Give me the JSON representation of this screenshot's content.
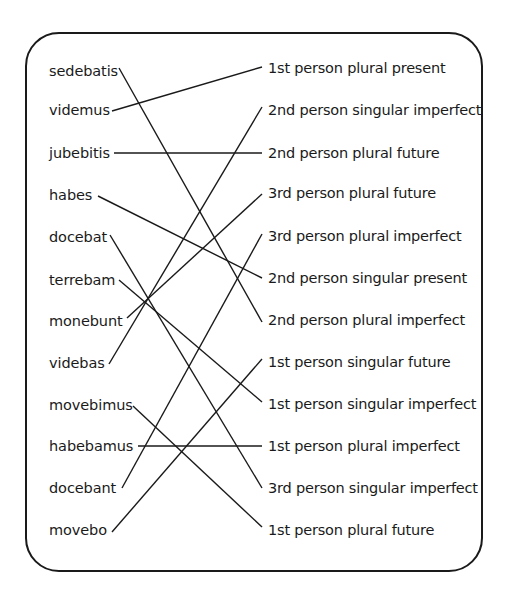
{
  "latin_words": [
    {
      "text": "sedebatis",
      "y": 62,
      "end_x": 118
    },
    {
      "text": "videmus",
      "y": 101,
      "end_x": 111
    },
    {
      "text": "jubebitis",
      "y": 144,
      "end_x": 113
    },
    {
      "text": "habes",
      "y": 186,
      "end_x": 97
    },
    {
      "text": "docebat",
      "y": 228,
      "end_x": 109
    },
    {
      "text": "terrebam",
      "y": 271,
      "end_x": 118
    },
    {
      "text": "monebunt",
      "y": 312,
      "end_x": 126
    },
    {
      "text": "videbas",
      "y": 354,
      "end_x": 109
    },
    {
      "text": "movebimus",
      "y": 396,
      "end_x": 132
    },
    {
      "text": "habebamus",
      "y": 437,
      "end_x": 137
    },
    {
      "text": "docebant",
      "y": 479,
      "end_x": 121
    },
    {
      "text": "movebo",
      "y": 521,
      "end_x": 112
    }
  ],
  "descriptions": [
    {
      "text": "1st person plural present",
      "y": 59
    },
    {
      "text": "2nd person singular imperfect",
      "y": 101
    },
    {
      "text": "2nd person plural future",
      "y": 144
    },
    {
      "text": "3rd person plural future",
      "y": 184
    },
    {
      "text": "3rd person plural imperfect",
      "y": 227
    },
    {
      "text": "2nd person singular present",
      "y": 269
    },
    {
      "text": "2nd person plural imperfect",
      "y": 311
    },
    {
      "text": "1st person singular future",
      "y": 353
    },
    {
      "text": "1st person singular imperfect",
      "y": 395
    },
    {
      "text": "1st person plural imperfect",
      "y": 437
    },
    {
      "text": "3rd person singular imperfect",
      "y": 479
    },
    {
      "text": "1st person plural future",
      "y": 521
    }
  ],
  "connections": [
    {
      "from": "sedebatis",
      "to": "2nd person plural imperfect",
      "x1": 119,
      "y1": 68,
      "x2": 262,
      "y2": 322
    },
    {
      "from": "videmus",
      "to": "1st person plural present",
      "x1": 112,
      "y1": 111,
      "x2": 262,
      "y2": 67
    },
    {
      "from": "jubebitis",
      "to": "2nd person plural future",
      "x1": 114,
      "y1": 153,
      "x2": 262,
      "y2": 153
    },
    {
      "from": "habes",
      "to": "2nd person singular present",
      "x1": 98,
      "y1": 196,
      "x2": 262,
      "y2": 278
    },
    {
      "from": "docebat",
      "to": "3rd person singular imperfect",
      "x1": 110,
      "y1": 235,
      "x2": 262,
      "y2": 488
    },
    {
      "from": "terrebam",
      "to": "1st person singular imperfect",
      "x1": 119,
      "y1": 280,
      "x2": 262,
      "y2": 402
    },
    {
      "from": "monebunt",
      "to": "3rd person plural future",
      "x1": 127,
      "y1": 318,
      "x2": 262,
      "y2": 194
    },
    {
      "from": "videbas",
      "to": "2nd person singular imperfect",
      "x1": 109,
      "y1": 364,
      "x2": 262,
      "y2": 107
    },
    {
      "from": "movebimus",
      "to": "1st person plural future",
      "x1": 133,
      "y1": 406,
      "x2": 262,
      "y2": 527
    },
    {
      "from": "habebamus",
      "to": "1st person plural imperfect",
      "x1": 138,
      "y1": 446,
      "x2": 262,
      "y2": 446
    },
    {
      "from": "docebant",
      "to": "3rd person plural imperfect",
      "x1": 122,
      "y1": 488,
      "x2": 262,
      "y2": 234
    },
    {
      "from": "movebo",
      "to": "1st person singular future",
      "x1": 112,
      "y1": 532,
      "x2": 262,
      "y2": 359
    }
  ]
}
